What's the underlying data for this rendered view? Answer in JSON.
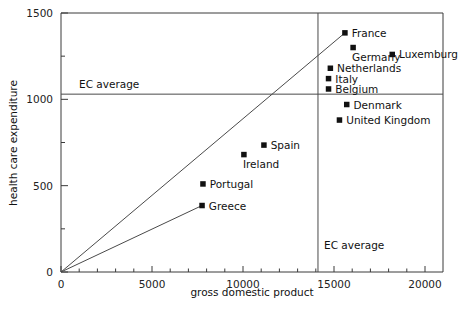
{
  "chart_data": {
    "type": "scatter",
    "title": "",
    "xlabel": "gross domestic product",
    "ylabel": "health care expenditure",
    "xlim": [
      0,
      20000
    ],
    "ylim": [
      0,
      1500
    ],
    "grid": false,
    "legend": "none",
    "x_ticks_major": [
      "0",
      "5000",
      "10000",
      "15000",
      "20000"
    ],
    "x_ticks_major_values": [
      0,
      5000,
      10000,
      15000,
      20000
    ],
    "x_ticks_minor_values": [
      1000,
      2000,
      3000,
      4000,
      6000,
      7000,
      8000,
      9000,
      11000,
      12000,
      13000,
      14000,
      16000,
      17000,
      18000,
      19000
    ],
    "y_ticks_major": [
      "0",
      "500",
      "1000",
      "1500"
    ],
    "y_ticks_major_values": [
      0,
      500,
      1000,
      1500
    ],
    "y_ticks_minor_values": [
      250,
      750,
      1250
    ],
    "points": [
      {
        "label": "France",
        "x": 15600,
        "y": 1385,
        "label_side": "right"
      },
      {
        "label": "Luxemburg",
        "x": 18200,
        "y": 1260,
        "label_side": "right"
      },
      {
        "label": "Germany",
        "x": 16050,
        "y": 1300,
        "label_side": "below-right"
      },
      {
        "label": "Netherlands",
        "x": 14800,
        "y": 1180,
        "label_side": "right"
      },
      {
        "label": "Italy",
        "x": 14700,
        "y": 1120,
        "label_side": "right"
      },
      {
        "label": "Belgium",
        "x": 14700,
        "y": 1060,
        "label_side": "right"
      },
      {
        "label": "Denmark",
        "x": 15700,
        "y": 970,
        "label_side": "right"
      },
      {
        "label": "United Kingdom",
        "x": 15300,
        "y": 880,
        "label_side": "right"
      },
      {
        "label": "Spain",
        "x": 11150,
        "y": 735,
        "label_side": "right"
      },
      {
        "label": "Ireland",
        "x": 10050,
        "y": 680,
        "label_side": "below-right"
      },
      {
        "label": "Portugal",
        "x": 7800,
        "y": 510,
        "label_side": "right"
      },
      {
        "label": "Greece",
        "x": 7750,
        "y": 385,
        "label_side": "right"
      }
    ],
    "reference_lines": [
      {
        "name": "ec-average-horizontal",
        "orientation": "horizontal",
        "value": 1030,
        "label": "EC average"
      },
      {
        "name": "ec-average-vertical",
        "orientation": "vertical",
        "value": 14120,
        "label": "EC average"
      }
    ],
    "trend_lines": [
      {
        "name": "upper-ray",
        "from": {
          "x": 0,
          "y": 0
        },
        "to": {
          "x": 15600,
          "y": 1385
        }
      },
      {
        "name": "lower-ray",
        "from": {
          "x": 0,
          "y": 0
        },
        "to": {
          "x": 7750,
          "y": 385
        }
      }
    ]
  },
  "labels": {
    "x_axis_title": "gross domestic product",
    "y_axis_title": "health care expenditure",
    "ec_average_horizontal": "EC average",
    "ec_average_vertical": "EC average"
  }
}
